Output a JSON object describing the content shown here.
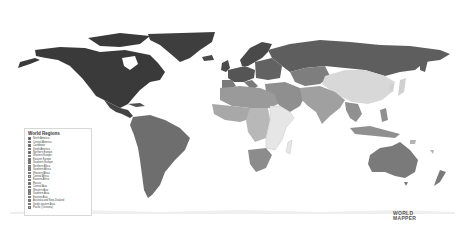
{
  "legend": {
    "title": "World Regions",
    "items": [
      {
        "label": "North America",
        "color": "#3a3a3a"
      },
      {
        "label": "Central America",
        "color": "#444444"
      },
      {
        "label": "Caribbean",
        "color": "#505050"
      },
      {
        "label": "South America",
        "color": "#6e6e6e"
      },
      {
        "label": "Northern Europe",
        "color": "#4a4a4a"
      },
      {
        "label": "Western Europe",
        "color": "#555555"
      },
      {
        "label": "Eastern Europe",
        "color": "#626262"
      },
      {
        "label": "Southern Europe",
        "color": "#7a7a7a"
      },
      {
        "label": "Northern Africa",
        "color": "#9a9a9a"
      },
      {
        "label": "Southern Africa",
        "color": "#8c8c8c"
      },
      {
        "label": "Western Africa",
        "color": "#a8a8a8"
      },
      {
        "label": "Central Africa",
        "color": "#b8b8b8"
      },
      {
        "label": "Eastern Africa",
        "color": "#e4e4e4"
      },
      {
        "label": "Russia",
        "color": "#666666"
      },
      {
        "label": "Central Asia",
        "color": "#7e7e7e"
      },
      {
        "label": "Western Asia",
        "color": "#8f8f8f"
      },
      {
        "label": "Southern Asia",
        "color": "#a0a0a0"
      },
      {
        "label": "Eastern Asia",
        "color": "#d8d8d8"
      },
      {
        "label": "Australia and New Zealand",
        "color": "#7a7a7a"
      },
      {
        "label": "South-eastern Asia",
        "color": "#909090"
      },
      {
        "label": "Pacific (Oceania)",
        "color": "#b4b4b4"
      }
    ]
  },
  "logo": {
    "line1": "WORLD",
    "line2": "MAPPER"
  },
  "colors": {
    "ocean": "#ffffff",
    "land_border": "#ffffff"
  }
}
